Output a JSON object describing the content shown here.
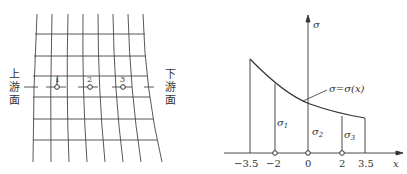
{
  "left_figure": {
    "upstream_label": [
      "上",
      "游",
      "面"
    ],
    "downstream_label": [
      "下",
      "游",
      "面"
    ],
    "points": [
      "1",
      "2",
      "3"
    ]
  },
  "right_figure": {
    "y_axis_label": "σ",
    "x_axis_label": "x",
    "curve_label": "σ=σ(x)",
    "x_ticks": [
      "−3.5",
      "−2",
      "0",
      "2",
      "3.5"
    ],
    "segment_labels": {
      "s1": "σ",
      "s1_sub": "1",
      "s2": "σ",
      "s2_sub": "2",
      "s3": "σ",
      "s3_sub": "3"
    }
  }
}
